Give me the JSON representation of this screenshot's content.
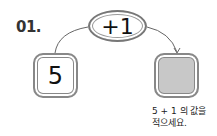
{
  "problem": {
    "number": "01.",
    "operation": "+1",
    "input_value": "5",
    "output_value": "",
    "instruction_line1": "5 + 1 의 값을",
    "instruction_line2": "적으세요."
  },
  "colors": {
    "answer_box_fill": "#c8c8c8",
    "border": "#888888"
  }
}
